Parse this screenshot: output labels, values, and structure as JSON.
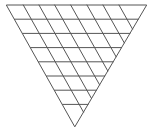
{
  "diagram": {
    "type": "subdivided-inverted-triangle",
    "stroke_color": "#555555",
    "background": "#ffffff",
    "triangle": {
      "top_left": [
        6.7,
        5
      ],
      "top_right": [
        146.7,
        5
      ],
      "bottom": [
        75,
        126.5
      ]
    },
    "horizontal_lines": [
      {
        "y": 19.2,
        "x1": 14.7,
        "x2": 138.3
      },
      {
        "y": 33.4,
        "x1": 22.7,
        "x2": 129.9
      },
      {
        "y": 47.6,
        "x1": 30.6,
        "x2": 121.6
      },
      {
        "y": 61.8,
        "x1": 38.6,
        "x2": 113.2
      },
      {
        "y": 76.0,
        "x1": 46.6,
        "x2": 104.8
      },
      {
        "y": 90.2,
        "x1": 54.6,
        "x2": 96.4
      },
      {
        "y": 104.4,
        "x1": 62.6,
        "x2": 88.0
      }
    ],
    "diagonal_lines": [
      {
        "x1": 23.3,
        "y1": 5,
        "x2": 83.5,
        "y2": 112.1
      },
      {
        "x1": 39.0,
        "y1": 5,
        "x2": 91.5,
        "y2": 98.5
      },
      {
        "x1": 54.7,
        "y1": 5,
        "x2": 99.6,
        "y2": 84.8
      },
      {
        "x1": 70.7,
        "y1": 5,
        "x2": 107.8,
        "y2": 71.0
      },
      {
        "x1": 87.0,
        "y1": 5,
        "x2": 116.1,
        "y2": 56.8
      },
      {
        "x1": 103.0,
        "y1": 5,
        "x2": 124.3,
        "y2": 42.9
      },
      {
        "x1": 119.0,
        "y1": 5,
        "x2": 132.5,
        "y2": 29.0
      }
    ]
  }
}
